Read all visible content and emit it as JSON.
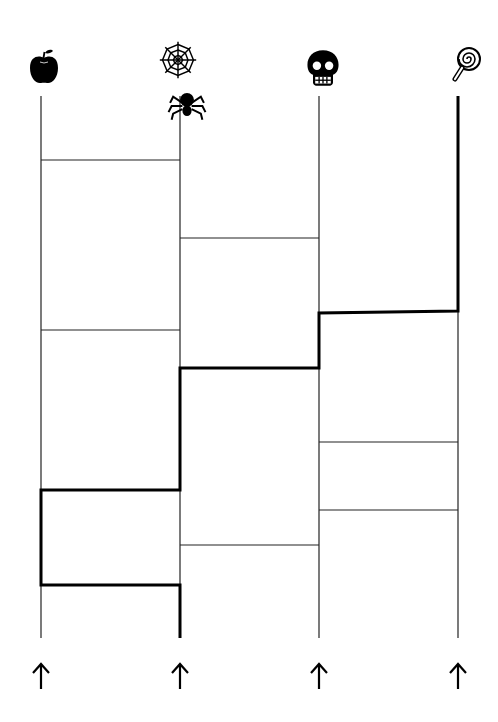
{
  "puzzle": {
    "type": "ladder (amidakuji)",
    "columns": [
      {
        "index": 0,
        "x": 41,
        "top_icon": "apple-icon",
        "bottom": "up-arrow"
      },
      {
        "index": 1,
        "x": 180,
        "top_icon": "spider-web-icon",
        "extra_icon": "spider-icon",
        "bottom": "up-arrow"
      },
      {
        "index": 2,
        "x": 319,
        "top_icon": "skull-icon",
        "bottom": "up-arrow"
      },
      {
        "index": 3,
        "x": 458,
        "top_icon": "lollipop-icon",
        "bottom": "up-arrow"
      }
    ],
    "line_top": 96,
    "line_bottom": 638,
    "rungs": [
      {
        "from": 0,
        "to": 1,
        "y": 160
      },
      {
        "from": 1,
        "to": 2,
        "y": 238
      },
      {
        "from": 2,
        "to": 3,
        "y": 312
      },
      {
        "from": 0,
        "to": 1,
        "y": 330
      },
      {
        "from": 1,
        "to": 2,
        "y": 368
      },
      {
        "from": 2,
        "to": 3,
        "y": 442
      },
      {
        "from": 0,
        "to": 1,
        "y": 490
      },
      {
        "from": 2,
        "to": 3,
        "y": 510
      },
      {
        "from": 1,
        "to": 2,
        "y": 545
      },
      {
        "from": 0,
        "to": 1,
        "y": 585
      }
    ],
    "highlighted_path": {
      "start_column": 1,
      "end_column": 3,
      "points": [
        [
          180,
          638
        ],
        [
          180,
          585
        ],
        [
          41,
          585
        ],
        [
          41,
          490
        ],
        [
          180,
          490
        ],
        [
          180,
          368
        ],
        [
          319,
          368
        ],
        [
          319,
          313
        ],
        [
          458,
          311
        ],
        [
          458,
          96
        ]
      ]
    }
  },
  "colors": {
    "line": "#000000",
    "background": "#ffffff"
  }
}
